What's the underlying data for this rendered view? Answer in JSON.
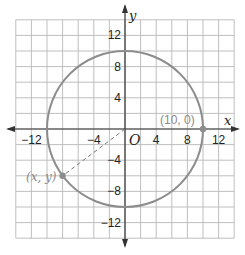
{
  "diagram": {
    "type": "coordinate-plane",
    "grid": {
      "min": -14,
      "max": 14,
      "step": 2
    },
    "axes": {
      "x_label": "x",
      "y_label": "y",
      "origin_label": "O",
      "x_ticks": [
        {
          "value": -12,
          "label": "−12"
        },
        {
          "value": -4,
          "label": "−4"
        },
        {
          "value": 4,
          "label": "4"
        },
        {
          "value": 8,
          "label": "8"
        },
        {
          "value": 12,
          "label": "12"
        }
      ],
      "y_ticks": [
        {
          "value": 12,
          "label": "12"
        },
        {
          "value": 8,
          "label": "8"
        },
        {
          "value": 4,
          "label": "4"
        },
        {
          "value": -4,
          "label": "−4"
        },
        {
          "value": -8,
          "label": "−8"
        },
        {
          "value": -12,
          "label": "−12"
        }
      ]
    },
    "circle": {
      "center": [
        0,
        0
      ],
      "radius": 10,
      "color": "#8c8c8c"
    },
    "points": [
      {
        "id": "p1",
        "coords": [
          10,
          0
        ],
        "label": "(10, 0)"
      },
      {
        "id": "p2",
        "coords": [
          -8,
          -6
        ],
        "label": "(x, y)"
      }
    ],
    "dashed_segment": {
      "from": [
        0,
        0
      ],
      "to": [
        -8,
        -6
      ]
    },
    "colors": {
      "grid": "#b8b8b8",
      "axis": "#333333",
      "circle": "#8c8c8c",
      "point": "#8c8c8c",
      "label": "#8a8a8a"
    }
  }
}
